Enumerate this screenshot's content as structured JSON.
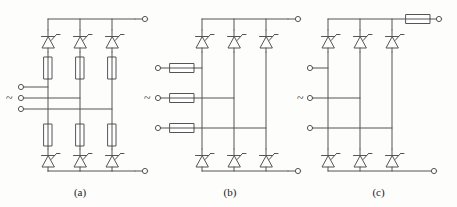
{
  "figure": {
    "type": "schematic-diagram",
    "stroke_color": "#555555",
    "background_color": "#fdfdfc",
    "text_color": "#1a1a1a"
  },
  "captions": {
    "a": "(a)",
    "b": "(b)",
    "c": "(c)"
  },
  "ac_symbol": "~",
  "circuits": [
    {
      "id": "a",
      "caption": "(a)",
      "fuse_arrangement": "series fuse in each of the six thyristor arms",
      "fuse_orientation": "vertical",
      "fuse_count": 6,
      "thyristor_count": 6,
      "ac_terminal_count": 3,
      "dc_terminal_count": 2,
      "ac_label": "~"
    },
    {
      "id": "b",
      "caption": "(b)",
      "fuse_arrangement": "one fuse in each of the three ac supply lines",
      "fuse_orientation": "horizontal",
      "fuse_count": 3,
      "thyristor_count": 6,
      "ac_terminal_count": 3,
      "dc_terminal_count": 2,
      "ac_label": "~"
    },
    {
      "id": "c",
      "caption": "(c)",
      "fuse_arrangement": "single fuse in the positive dc output line",
      "fuse_orientation": "horizontal",
      "fuse_count": 1,
      "thyristor_count": 6,
      "ac_terminal_count": 3,
      "dc_terminal_count": 2,
      "ac_label": "~"
    }
  ],
  "components": {
    "thyristor": "thyristor-scr-symbol",
    "fuse": "fuse-rectangle-symbol",
    "terminal": "open-circle-terminal"
  }
}
